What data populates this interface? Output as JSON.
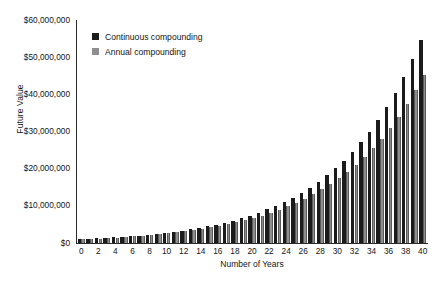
{
  "chart_data": {
    "type": "bar",
    "title": "",
    "subtitle": "",
    "xlabel": "Number of Years",
    "ylabel": "Future Value",
    "grid": false,
    "legend_position": "top-left-inside",
    "xlim": [
      0,
      40
    ],
    "ylim": [
      0,
      60000000
    ],
    "ytick_values": [
      0,
      10000000,
      20000000,
      30000000,
      40000000,
      50000000,
      60000000
    ],
    "ytick_labels": [
      "$0",
      "$10,000,000",
      "$20,000,000",
      "$30,000,000",
      "$40,000,000",
      "$50,000,000",
      "$60,000,000"
    ],
    "xtick_values": [
      0,
      2,
      4,
      6,
      8,
      10,
      12,
      14,
      16,
      18,
      20,
      22,
      24,
      26,
      28,
      30,
      32,
      34,
      36,
      38,
      40
    ],
    "xtick_labels": [
      "0",
      "2",
      "4",
      "6",
      "8",
      "10",
      "12",
      "14",
      "16",
      "18",
      "20",
      "22",
      "24",
      "26",
      "28",
      "30",
      "32",
      "34",
      "36",
      "38",
      "40"
    ],
    "categories": [
      0,
      1,
      2,
      3,
      4,
      5,
      6,
      7,
      8,
      9,
      10,
      11,
      12,
      13,
      14,
      15,
      16,
      17,
      18,
      19,
      20,
      21,
      22,
      23,
      24,
      25,
      26,
      27,
      28,
      29,
      30,
      31,
      32,
      33,
      34,
      35,
      36,
      37,
      38,
      39,
      40
    ],
    "series": [
      {
        "name": "Continuous compounding",
        "color": "#1b1b1b",
        "values": [
          1000000,
          1105171,
          1221403,
          1349859,
          1491825,
          1648721,
          1822119,
          2013753,
          2225541,
          2459603,
          2718282,
          3004166,
          3320117,
          3669297,
          4055200,
          4481689,
          4953032,
          5473947,
          6049647,
          6685894,
          7389056,
          8166170,
          9025013,
          9974182,
          11023176,
          12182494,
          13463738,
          14879732,
          16444647,
          18174145,
          20085537,
          22197951,
          24532530,
          27112639,
          29964100,
          33115452,
          36598234,
          40447236,
          44701184,
          49402449,
          54598150
        ]
      },
      {
        "name": "Annual compounding",
        "color": "#8e8e8e",
        "values": [
          1000000,
          1100000,
          1210000,
          1331000,
          1464100,
          1610510,
          1771561,
          1948717,
          2143589,
          2357948,
          2593742,
          2853117,
          3138428,
          3452271,
          3797498,
          4177248,
          4594973,
          5054470,
          5559917,
          6115909,
          6727500,
          7400250,
          8140275,
          8954302,
          9849733,
          10834706,
          11918177,
          13109994,
          14420994,
          15863093,
          17449402,
          19194342,
          21113777,
          23225154,
          25547670,
          28102437,
          30912681,
          34003949,
          37404344,
          41144778,
          45259256
        ]
      }
    ]
  },
  "legend": {
    "items": [
      {
        "label": "Continuous compounding",
        "color": "#1b1b1b"
      },
      {
        "label": "Annual compounding",
        "color": "#8e8e8e"
      }
    ]
  }
}
